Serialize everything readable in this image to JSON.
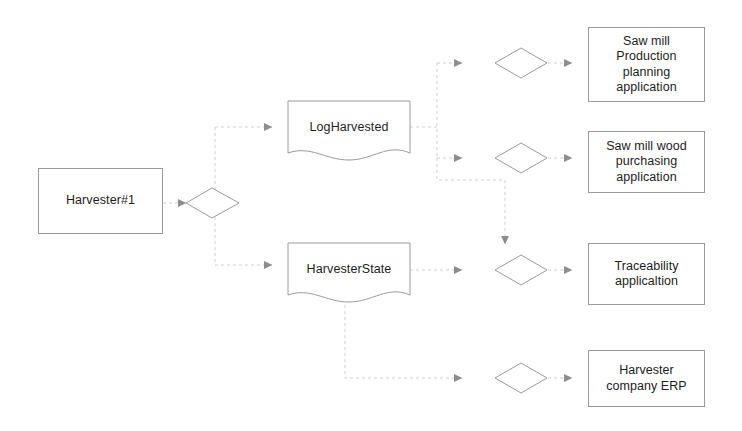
{
  "diagram": {
    "stroke_color": "#9a9a9a",
    "faint_stroke_color": "#d6d6d6",
    "arrow_color": "#808080",
    "text_color": "#1d1d1d",
    "background": "#ffffff"
  },
  "source": {
    "label": "Harvester#1",
    "shape": "rectangle"
  },
  "documents": [
    {
      "id": "log-harvested",
      "label": "LogHarvested",
      "shape": "document"
    },
    {
      "id": "harvester-state",
      "label": "HarvesterState",
      "shape": "document"
    }
  ],
  "gateways": [
    {
      "id": "gateway-source",
      "shape": "diamond",
      "label": ""
    },
    {
      "id": "gateway-production",
      "shape": "diamond",
      "label": ""
    },
    {
      "id": "gateway-purchasing",
      "shape": "diamond",
      "label": ""
    },
    {
      "id": "gateway-traceability",
      "shape": "diamond",
      "label": ""
    },
    {
      "id": "gateway-erp",
      "shape": "diamond",
      "label": ""
    }
  ],
  "applications": [
    {
      "id": "saw-mill-production-planning",
      "label": "Saw mill\nProduction\nplanning\napplication",
      "shape": "rectangle"
    },
    {
      "id": "saw-mill-wood-purchasing",
      "label": "Saw mill wood\npurchasing\napplication",
      "shape": "rectangle"
    },
    {
      "id": "traceability",
      "label": "Traceability\napplicaltion",
      "shape": "rectangle"
    },
    {
      "id": "harvester-company-erp",
      "label": "Harvester\ncompany ERP",
      "shape": "rectangle"
    }
  ]
}
